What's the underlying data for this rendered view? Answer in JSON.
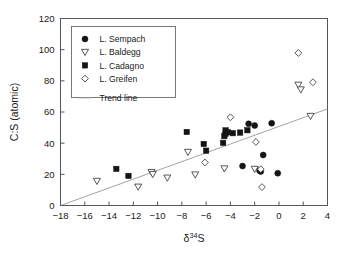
{
  "chart_data": {
    "type": "scatter",
    "title": "",
    "xlabel": "δ³⁴S",
    "ylabel": "C:S (atomic)",
    "xlim": [
      -18,
      4
    ],
    "ylim": [
      0,
      120
    ],
    "xticks": [
      -18,
      -16,
      -14,
      -12,
      -10,
      -8,
      -6,
      -4,
      -2,
      0,
      2,
      4
    ],
    "xtick_labels": [
      "−18",
      "−16",
      "−14",
      "−12",
      "−10",
      "−8",
      "−6",
      "−4",
      "−2",
      "0",
      "2",
      "4"
    ],
    "yticks": [
      0,
      20,
      40,
      60,
      80,
      100,
      120
    ],
    "ytick_labels": [
      "0",
      "20",
      "40",
      "60",
      "80",
      "100",
      "120"
    ],
    "grid": false,
    "legend_position": "top-left",
    "series": [
      {
        "name": "L. Sempach",
        "marker": "filled-circle",
        "color": "#141414",
        "points": [
          {
            "x": -3.0,
            "y": 25.3
          },
          {
            "x": -2.5,
            "y": 52.4
          },
          {
            "x": -2.0,
            "y": 51.3
          },
          {
            "x": -1.6,
            "y": 22.4
          },
          {
            "x": -1.5,
            "y": 21.8
          },
          {
            "x": -1.3,
            "y": 32.4
          },
          {
            "x": -0.6,
            "y": 52.8
          },
          {
            "x": -0.1,
            "y": 20.7
          }
        ]
      },
      {
        "name": "L. Baldegg",
        "marker": "open-triangle-down",
        "color": "#3a3a3a",
        "points": [
          {
            "x": -15.0,
            "y": 15.6
          },
          {
            "x": -11.6,
            "y": 11.9
          },
          {
            "x": -10.5,
            "y": 21.3
          },
          {
            "x": -10.4,
            "y": 20.0
          },
          {
            "x": -9.2,
            "y": 17.7
          },
          {
            "x": -7.5,
            "y": 34.2
          },
          {
            "x": -6.9,
            "y": 19.7
          },
          {
            "x": -4.5,
            "y": 23.6
          },
          {
            "x": -2.0,
            "y": 23.3
          },
          {
            "x": 1.6,
            "y": 77.3
          },
          {
            "x": 1.8,
            "y": 74.3
          },
          {
            "x": 2.6,
            "y": 57.3
          }
        ]
      },
      {
        "name": "L. Cadagno",
        "marker": "filled-square",
        "color": "#141414",
        "points": [
          {
            "x": -13.4,
            "y": 23.5
          },
          {
            "x": -12.4,
            "y": 19.0
          },
          {
            "x": -7.6,
            "y": 47.2
          },
          {
            "x": -6.2,
            "y": 39.5
          },
          {
            "x": -6.0,
            "y": 35.2
          },
          {
            "x": -4.6,
            "y": 40.2
          },
          {
            "x": -4.5,
            "y": 44.5
          },
          {
            "x": -4.4,
            "y": 46.0
          },
          {
            "x": -4.4,
            "y": 48.2
          },
          {
            "x": -4.2,
            "y": 47.0
          },
          {
            "x": -3.8,
            "y": 46.4
          },
          {
            "x": -3.2,
            "y": 46.8
          },
          {
            "x": -2.6,
            "y": 48.3
          }
        ]
      },
      {
        "name": "L. Greifen",
        "marker": "open-diamond",
        "color": "#3a3a3a",
        "points": [
          {
            "x": -6.1,
            "y": 27.6
          },
          {
            "x": -4.0,
            "y": 56.6
          },
          {
            "x": -1.9,
            "y": 40.8
          },
          {
            "x": -1.5,
            "y": 23.3
          },
          {
            "x": -1.4,
            "y": 11.8
          },
          {
            "x": 1.6,
            "y": 97.9
          },
          {
            "x": 2.8,
            "y": 79.1
          }
        ]
      }
    ],
    "trend_line": {
      "name": "Trend line",
      "color": "#9a9a9a",
      "x1": -18.0,
      "y1": 0.0,
      "x2": 4.0,
      "y2": 62.0
    },
    "legend_entries": [
      {
        "label": "L. Sempach",
        "marker": "filled-circle"
      },
      {
        "label": "L. Baldegg",
        "marker": "open-triangle-down"
      },
      {
        "label": "L. Cadagno",
        "marker": "filled-square"
      },
      {
        "label": "L. Greifen",
        "marker": "open-diamond"
      },
      {
        "label": "Trend line",
        "marker": "line"
      }
    ]
  }
}
